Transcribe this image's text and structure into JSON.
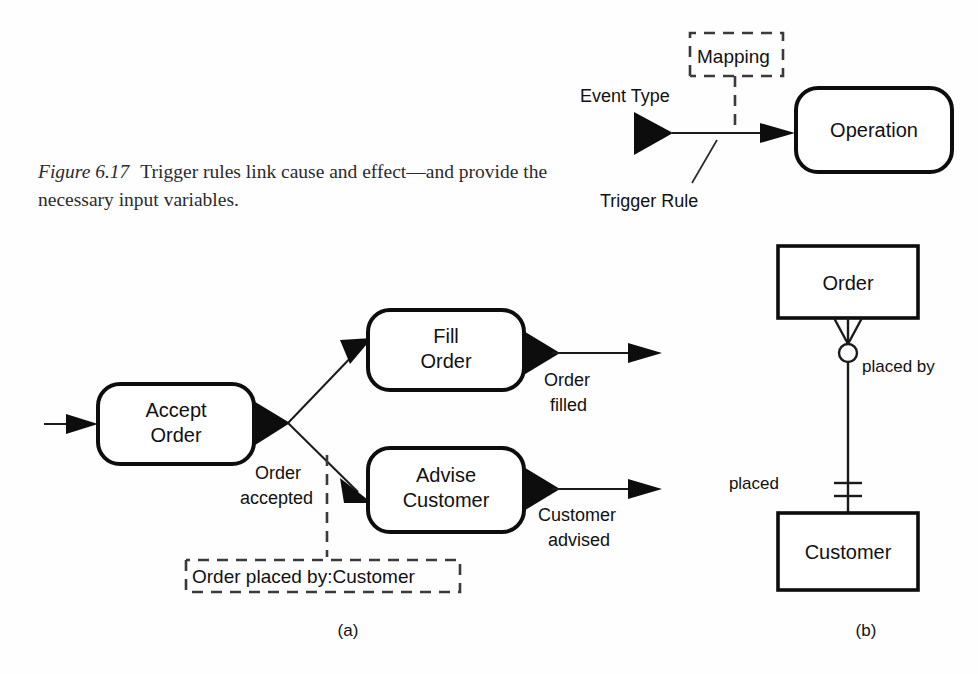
{
  "figure": {
    "label": "Figure 6.17",
    "caption_line1": "Trigger rules link cause and effect—and",
    "caption_line2": "provide the necessary input variables."
  },
  "sublabels": {
    "left": "(a)",
    "right": "(b)"
  },
  "panel_b_top": {
    "event_type_label": "Event Type",
    "trigger_rule_label": "Trigger Rule",
    "mapping_note": "Mapping",
    "operation_box": "Operation"
  },
  "panel_a": {
    "boxes": [
      {
        "line1": "Accept",
        "line2": "Order"
      },
      {
        "line1": "Fill",
        "line2": "Order"
      },
      {
        "line1": "Advise",
        "line2": "Customer"
      }
    ],
    "events": [
      {
        "line1": "Order",
        "line2": "accepted"
      },
      {
        "line1": "Order",
        "line2": "filled"
      },
      {
        "line1": "Customer",
        "line2": "advised"
      }
    ],
    "note": "Order placed by:Customer"
  },
  "panel_b_bottom": {
    "entity_top": "Order",
    "entity_bottom": "Customer",
    "role_top": "placed by",
    "role_bottom": "placed"
  },
  "colors": {
    "ink": "#0d0d0d",
    "paper": "#fefefe",
    "dashed": "#3a3a3a",
    "sublabel": "#4a4a4a"
  }
}
